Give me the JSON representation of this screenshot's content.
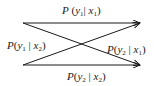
{
  "diagram": {
    "type": "channel-transition-diagram",
    "inputs": [
      "x1",
      "x2"
    ],
    "outputs": [
      "y1",
      "y2"
    ],
    "edges": [
      {
        "from": "x1",
        "to": "y1",
        "label": {
          "fn": "P",
          "y": "y",
          "ysub": "1",
          "x": "x",
          "xsub": "1"
        }
      },
      {
        "from": "x1",
        "to": "y2",
        "label": {
          "fn": "P",
          "y": "y",
          "ysub": "2",
          "x": "x",
          "xsub": "1"
        }
      },
      {
        "from": "x2",
        "to": "y1",
        "label": {
          "fn": "P",
          "y": "y",
          "ysub": "1",
          "x": "x",
          "xsub": "2"
        }
      },
      {
        "from": "x2",
        "to": "y2",
        "label": {
          "fn": "P",
          "y": "y",
          "ysub": "2",
          "x": "x",
          "xsub": "2"
        }
      }
    ],
    "colors": {
      "stroke": "#1a1a1a",
      "background": "#ffffff"
    }
  }
}
